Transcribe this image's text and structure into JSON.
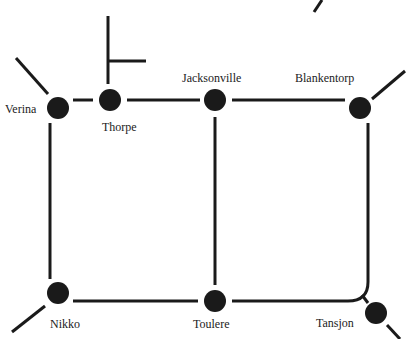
{
  "diagram": {
    "type": "rail-network-map",
    "line_color": "#1a1a1a",
    "station_color": "#1a1a1a",
    "stations": [
      {
        "name": "Verina",
        "x": 58,
        "y": 108
      },
      {
        "name": "Thorpe",
        "x": 110,
        "y": 100
      },
      {
        "name": "Jacksonville",
        "x": 215,
        "y": 100
      },
      {
        "name": "Blankentorp",
        "x": 360,
        "y": 108
      },
      {
        "name": "Nikko",
        "x": 58,
        "y": 293
      },
      {
        "name": "Toulere",
        "x": 215,
        "y": 301
      },
      {
        "name": "Tansjon",
        "x": 376,
        "y": 313
      }
    ],
    "labels": {
      "verina": "Verina",
      "thorpe": "Thorpe",
      "jacksonville": "Jacksonville",
      "blankentorp": "Blankentorp",
      "nikko": "Nikko",
      "toulere": "Toulere",
      "tansjon": "Tansjon"
    }
  }
}
